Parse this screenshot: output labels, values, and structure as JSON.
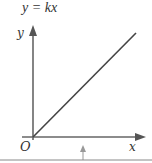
{
  "title": "y = kx",
  "axes": {
    "y_label": "y",
    "x_label": "x",
    "origin_label": "O"
  },
  "line": {
    "description": "straight line through origin with positive slope",
    "color": "#444444"
  },
  "axis_color": "#666666",
  "marker": {
    "description": "small upward arrow below x-axis",
    "color": "#999999"
  }
}
